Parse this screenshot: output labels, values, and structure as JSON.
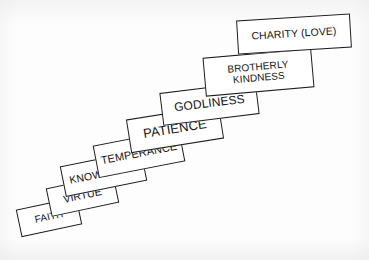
{
  "diagram": {
    "type": "ascending-steps",
    "title": "",
    "background_color": "#fdfdfd",
    "box_fill_color": "#ffffff",
    "box_border_color": "#1d1d1d",
    "text_color": "#141414",
    "direction": "lower-left to upper-right",
    "step_count": 8,
    "steps": [
      {
        "id": "faith",
        "label": "FAITH",
        "order": 1,
        "rotation_deg": -12
      },
      {
        "id": "virtue",
        "label": "VIRTUE",
        "order": 2,
        "rotation_deg": -12
      },
      {
        "id": "knowledge",
        "label": "KNOWLEDGE",
        "order": 3,
        "rotation_deg": -11.5
      },
      {
        "id": "temperance",
        "label": "TEMPERANCE",
        "order": 4,
        "rotation_deg": -11
      },
      {
        "id": "patience",
        "label": "PATIENCE",
        "order": 5,
        "rotation_deg": -9
      },
      {
        "id": "godliness",
        "label": "GODLINESS",
        "order": 6,
        "rotation_deg": -7
      },
      {
        "id": "brotherly-kindness",
        "label": "BROTHERLY\nKINDNESS",
        "order": 7,
        "rotation_deg": -5
      },
      {
        "id": "charity-love",
        "label": "CHARITY (LOVE)",
        "order": 8,
        "rotation_deg": -3.5
      }
    ]
  }
}
